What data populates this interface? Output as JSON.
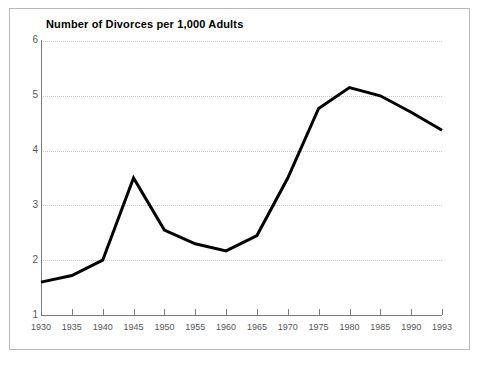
{
  "chart_data": {
    "type": "line",
    "title": "Number of Divorces per 1,000 Adults",
    "xlabel": "",
    "ylabel": "",
    "categories": [
      "1930",
      "1935",
      "1940",
      "1945",
      "1950",
      "1955",
      "1960",
      "1965",
      "1970",
      "1975",
      "1980",
      "1985",
      "1990",
      "1993"
    ],
    "values": [
      1.6,
      1.72,
      2.0,
      3.5,
      2.55,
      2.3,
      2.17,
      2.45,
      3.5,
      4.77,
      5.15,
      5.0,
      4.7,
      4.37
    ],
    "series": [
      {
        "name": "Number of Divorces per 1,000 Adults",
        "values": [
          1.6,
          1.72,
          2.0,
          3.5,
          2.55,
          2.3,
          2.17,
          2.45,
          3.5,
          4.77,
          5.15,
          5.0,
          4.7,
          4.37
        ]
      }
    ],
    "xlim": [
      "1930",
      "1993"
    ],
    "ylim": [
      1,
      6
    ],
    "yticks": [
      1,
      2,
      3,
      4,
      5,
      6
    ],
    "ytick_labels": [
      "1",
      "2",
      "3",
      "4",
      "5",
      "6"
    ],
    "xticks": [
      "1930",
      "1935",
      "1940",
      "1945",
      "1950",
      "1955",
      "1960",
      "1965",
      "1970",
      "1975",
      "1980",
      "1985",
      "1990",
      "1993"
    ],
    "grid": "horizontal-dotted",
    "legend": "none",
    "line_color": "#000000",
    "line_width": 3,
    "grid_color": "#c8c8c8",
    "axis_color": "#7a7a7a",
    "frame_color": "#b9b9b9",
    "background": "#ffffff"
  }
}
